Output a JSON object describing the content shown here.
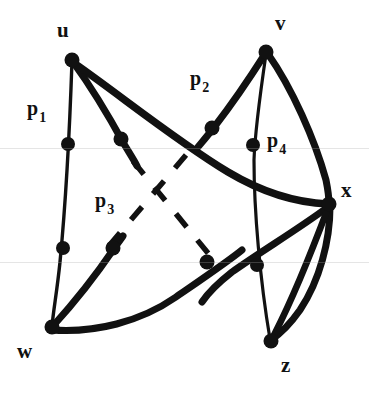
{
  "figure": {
    "type": "graph-diagram",
    "title": "",
    "background_color": "#ffffff",
    "stroke_color": "#111111",
    "width": 369,
    "height": 395
  },
  "vertices": [
    {
      "id": "u",
      "label": "u",
      "x": 72,
      "y": 60,
      "label_x": 57,
      "label_y": 20
    },
    {
      "id": "v",
      "label": "v",
      "x": 266,
      "y": 52,
      "label_x": 275,
      "label_y": 13
    },
    {
      "id": "w",
      "label": "w",
      "x": 52,
      "y": 327,
      "label_x": 17,
      "label_y": 341
    },
    {
      "id": "x",
      "label": "x",
      "x": 329,
      "y": 204,
      "label_x": 341,
      "label_y": 180
    },
    {
      "id": "z",
      "label": "z",
      "x": 271,
      "y": 341,
      "label_x": 281,
      "label_y": 355
    }
  ],
  "marked_points": [
    {
      "id": "p1_dot",
      "x": 68,
      "y": 144
    },
    {
      "id": "p1b_dot",
      "x": 63,
      "y": 248
    },
    {
      "id": "p3a_dot",
      "x": 121,
      "y": 139
    },
    {
      "id": "p3b_dot",
      "x": 113,
      "y": 248
    },
    {
      "id": "p2_dot",
      "x": 212,
      "y": 128
    },
    {
      "id": "p4_dot",
      "x": 253,
      "y": 145
    },
    {
      "id": "c1_dot",
      "x": 207,
      "y": 262
    },
    {
      "id": "c2_dot",
      "x": 257,
      "y": 265
    }
  ],
  "path_labels": [
    {
      "id": "p1",
      "base": "p",
      "sub": "1",
      "x": 27,
      "y": 98
    },
    {
      "id": "p2",
      "base": "p",
      "sub": "2",
      "x": 190,
      "y": 68
    },
    {
      "id": "p3",
      "base": "p",
      "sub": "3",
      "x": 95,
      "y": 190
    },
    {
      "id": "p4",
      "base": "p",
      "sub": "4",
      "x": 267,
      "y": 130
    }
  ],
  "edges": [
    {
      "id": "u-w-left",
      "from": "u",
      "to": "w",
      "style": "thin",
      "note": "left vertical curve through p1 dots"
    },
    {
      "id": "u-mid",
      "from": "u",
      "to": "mid",
      "style": "thick",
      "note": "thick stub from u down-right ending near center"
    },
    {
      "id": "u-x-curve",
      "from": "u",
      "to": "x",
      "style": "thick",
      "note": "long sweeping curve u to x"
    },
    {
      "id": "w-p3-stub",
      "from": "w",
      "to": "p3",
      "style": "thick",
      "note": "thick stub from w up-right"
    },
    {
      "id": "w-z-curve",
      "from": "w",
      "to": "z",
      "style": "thick",
      "note": "bottom curve w to z"
    },
    {
      "id": "v-p2-stub",
      "from": "v",
      "to": "p2",
      "style": "thick",
      "note": "thick stub from v down-left"
    },
    {
      "id": "v-z-thin",
      "from": "v",
      "to": "z",
      "style": "thin",
      "note": "thin line v down through p4 to z"
    },
    {
      "id": "v-x-thick",
      "from": "v",
      "to": "x",
      "style": "thick",
      "note": "thick curve v to x"
    },
    {
      "id": "x-z-thick",
      "from": "x",
      "to": "z",
      "style": "thick",
      "note": "thick curve x to z right side"
    },
    {
      "id": "x-cross-sw",
      "from": "x",
      "to": "sw",
      "style": "thick",
      "note": "thick line x to lower-left crossing"
    },
    {
      "id": "x-z-inner",
      "from": "x",
      "to": "z",
      "style": "thick",
      "note": "inner straight x to z"
    }
  ],
  "dashed_segments": [
    {
      "id": "dash-nw-se",
      "note": "dashed diagonal from upper-left to lower-right"
    },
    {
      "id": "dash-ne-sw",
      "note": "dashed diagonal from upper-right to lower-left"
    }
  ],
  "scan_bands": [
    148,
    262
  ]
}
